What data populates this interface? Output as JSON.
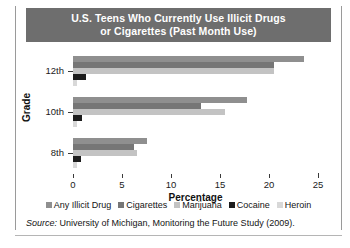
{
  "title": {
    "line1": "U.S. Teens Who Currently Use Illicit Drugs",
    "line2": "or Cigarettes (Past Month Use)"
  },
  "axes": {
    "y_title": "Grade",
    "x_title": "Percentage"
  },
  "source": {
    "label": "Source:",
    "text": "University of Michigan, Monitoring the Future Study (2009)."
  },
  "chart_data": {
    "type": "bar",
    "orientation": "horizontal",
    "title": "U.S. Teens Who Currently Use Illicit Drugs or Cigarettes (Past Month Use)",
    "xlabel": "Percentage",
    "ylabel": "Grade",
    "xlim": [
      0,
      25
    ],
    "xticks": [
      0,
      5,
      10,
      15,
      20,
      25
    ],
    "grid": false,
    "legend_position": "bottom",
    "categories": [
      "12th",
      "10th",
      "8th"
    ],
    "series": [
      {
        "name": "Any Illicit Drug",
        "color": "#8f8f8f",
        "values": [
          23.6,
          17.8,
          7.6
        ]
      },
      {
        "name": "Cigarettes",
        "color": "#767676",
        "values": [
          20.5,
          13.1,
          6.2
        ]
      },
      {
        "name": "Marijuana",
        "color": "#c3c3c3",
        "values": [
          20.5,
          15.5,
          6.5
        ]
      },
      {
        "name": "Cocaine",
        "color": "#1c1c1c",
        "values": [
          1.3,
          0.9,
          0.8
        ]
      },
      {
        "name": "Heroin",
        "color": "#d8d8d8",
        "values": [
          0.4,
          0.4,
          0.4
        ]
      }
    ]
  }
}
